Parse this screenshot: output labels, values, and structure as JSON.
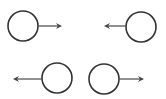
{
  "diagram": {
    "title": "",
    "colors": {
      "background": "#ffffff",
      "circle_stroke": "#333333",
      "arrow": "#555555"
    },
    "figures": [
      {
        "id": "top-left",
        "circle": {
          "cx": 23,
          "cy": 26,
          "r": 15
        },
        "arrow": {
          "x1": 38,
          "y1": 26,
          "x2": 62,
          "y2": 26,
          "direction": "right"
        }
      },
      {
        "id": "top-right",
        "circle": {
          "cx": 141,
          "cy": 27,
          "r": 15
        },
        "arrow": {
          "x1": 126,
          "y1": 26,
          "x2": 104,
          "y2": 26,
          "direction": "left"
        }
      },
      {
        "id": "bottom-left",
        "circle": {
          "cx": 57,
          "cy": 78,
          "r": 15
        },
        "arrow": {
          "x1": 42,
          "y1": 79,
          "x2": 13,
          "y2": 79,
          "direction": "left"
        }
      },
      {
        "id": "bottom-right",
        "circle": {
          "cx": 104,
          "cy": 79,
          "r": 15
        },
        "arrow": {
          "x1": 119,
          "y1": 79,
          "x2": 144,
          "y2": 79,
          "direction": "right"
        }
      }
    ]
  }
}
